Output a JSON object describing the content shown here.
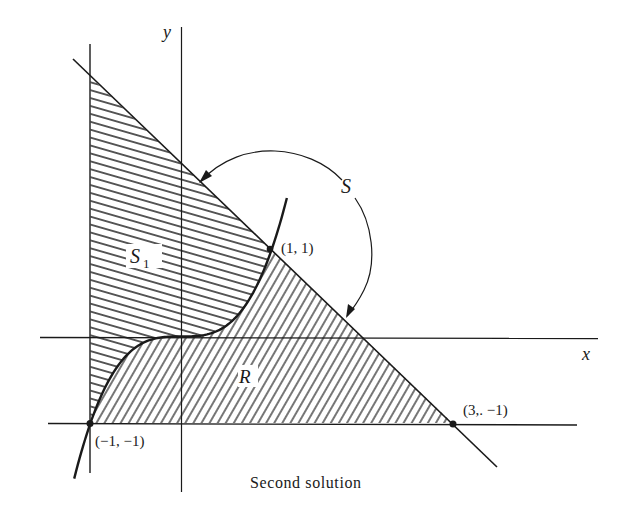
{
  "figure": {
    "caption": "Second solution",
    "labels": {
      "y_axis": "y",
      "x_axis": "x",
      "region_s1": "S",
      "region_s1_sub": "1",
      "region_r": "R",
      "region_s": "S",
      "point_1_1": "(1, 1)",
      "point_m1_m1": "(−1, −1)",
      "point_3_m1": "(3,. −1)"
    },
    "colors": {
      "ink": "#1a1a1a",
      "background": "#ffffff"
    }
  },
  "chart_data": {
    "type": "diagram",
    "title": "",
    "caption": "Second solution",
    "xlabel": "x",
    "ylabel": "y",
    "curves": [
      {
        "name": "cubic",
        "equation": "y = x^3",
        "x_range": [
          -1.18,
          1.17
        ]
      },
      {
        "name": "line",
        "equation": "y = 2 - x",
        "x_range": [
          -1.2,
          3.5
        ]
      },
      {
        "name": "vertical line",
        "equation": "x = -1"
      },
      {
        "name": "horizontal line",
        "equation": "y = -1"
      }
    ],
    "points": [
      {
        "label": "(1, 1)",
        "x": 1,
        "y": 1
      },
      {
        "label": "(-1, -1)",
        "x": -1,
        "y": -1
      },
      {
        "label": "(3, -1)",
        "x": 3,
        "y": -1
      }
    ],
    "regions": [
      {
        "name": "S1",
        "bounded_by": [
          "x = -1",
          "y = 2 - x",
          "y = x^3"
        ],
        "hatch": "near-horizontal"
      },
      {
        "name": "R",
        "bounded_by": [
          "y = x^3",
          "y = 2 - x",
          "y = -1"
        ],
        "hatch": "diagonal"
      },
      {
        "name": "S",
        "description": "whole triangle S1 + R, indicated by curved arrow"
      }
    ],
    "pixel_mapping": {
      "origin_px": [
        181,
        336.5
      ],
      "unit_x_px": 90.5,
      "unit_y_px": 86.5
    }
  }
}
